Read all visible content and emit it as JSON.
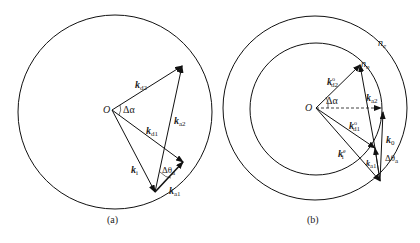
{
  "figure_a": {
    "caption": "(a)",
    "origin_label": "O",
    "angle_label": "Δα",
    "vectors": {
      "k_d2": {
        "base": "k",
        "sub": "d2"
      },
      "k_d1": {
        "base": "k",
        "sub": "d1"
      },
      "k_a2": {
        "base": "k",
        "sub": "a2"
      },
      "k_i": {
        "base": "k",
        "sub": "i"
      },
      "k_a1": {
        "base": "k",
        "sub": "a1"
      }
    },
    "theta_label": {
      "base": "Δθ",
      "sub": "a"
    }
  },
  "figure_b": {
    "caption": "(b)",
    "origin_label": "O",
    "angle_label": "Δα",
    "outer_circle_label": {
      "base": "n",
      "sub": "e"
    },
    "inner_circle_label": {
      "base": "n",
      "sub": "o"
    },
    "vectors": {
      "k_d2": {
        "base": "k",
        "sub": "d2",
        "sup": "o"
      },
      "k_d1": {
        "base": "k",
        "sub": "d1",
        "sup": "o"
      },
      "k_a2": {
        "base": "k",
        "sub": "a2"
      },
      "k_i": {
        "base": "k",
        "sub": "i",
        "sup": "e"
      },
      "k_a1": {
        "base": "k",
        "sub": "a1"
      },
      "k_0": {
        "base": "k",
        "sub": "0"
      }
    },
    "theta_label": {
      "base": "Δθ",
      "sub": "a"
    }
  }
}
